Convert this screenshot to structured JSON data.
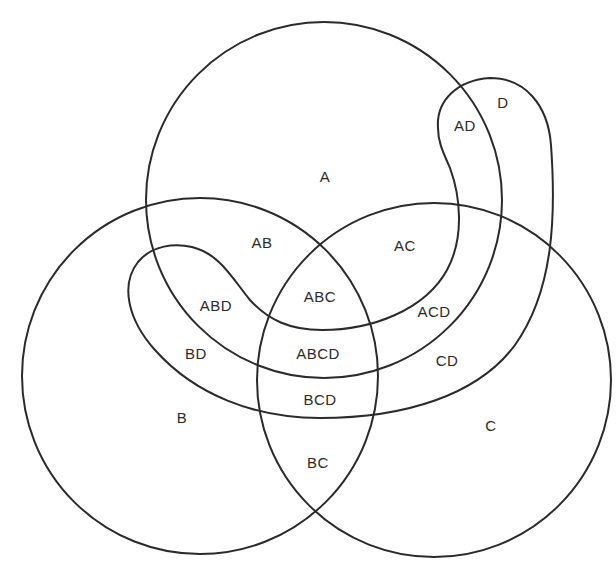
{
  "diagram": {
    "type": "venn",
    "sets": [
      {
        "id": "A",
        "label": "A",
        "shape": "circle",
        "cx": 324,
        "cy": 200,
        "r": 178
      },
      {
        "id": "B",
        "label": "B",
        "shape": "circle",
        "cx": 200,
        "cy": 376,
        "r": 178
      },
      {
        "id": "C",
        "label": "C",
        "shape": "circle",
        "cx": 434,
        "cy": 380,
        "r": 177
      },
      {
        "id": "D",
        "label": "D",
        "shape": "curved-band"
      }
    ],
    "regions": {
      "A": {
        "label": "A",
        "x": 325,
        "y": 176
      },
      "B": {
        "label": "B",
        "x": 182,
        "y": 417
      },
      "C": {
        "label": "C",
        "x": 491,
        "y": 425
      },
      "D": {
        "label": "D",
        "x": 503,
        "y": 102
      },
      "AB": {
        "label": "AB",
        "x": 262,
        "y": 242
      },
      "AC": {
        "label": "AC",
        "x": 405,
        "y": 245
      },
      "AD": {
        "label": "AD",
        "x": 465,
        "y": 125
      },
      "ABC": {
        "label": "ABC",
        "x": 320,
        "y": 296
      },
      "ABD": {
        "label": "ABD",
        "x": 216,
        "y": 305
      },
      "ACD": {
        "label": "ACD",
        "x": 434,
        "y": 311
      },
      "BD": {
        "label": "BD",
        "x": 196,
        "y": 353
      },
      "CD": {
        "label": "CD",
        "x": 447,
        "y": 360
      },
      "ABCD": {
        "label": "ABCD",
        "x": 318,
        "y": 353
      },
      "BCD": {
        "label": "BCD",
        "x": 320,
        "y": 399
      },
      "BC": {
        "label": "BC",
        "x": 318,
        "y": 462
      }
    }
  }
}
